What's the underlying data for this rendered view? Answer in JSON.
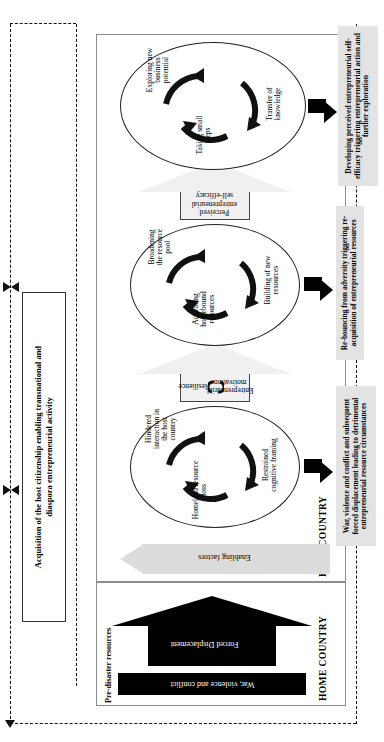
{
  "figure": {
    "top_box": {
      "line1": "Acquisition of the host citizenship enabling transnational and",
      "line2": "diaspora entrepreneurial activity"
    },
    "panels": {
      "home_label": "HOME COUNTRY",
      "host_label": "HOST COUNTRY"
    },
    "home_country": {
      "pre_disaster_label": "Pre-disaster resources",
      "war_bar_label": "War, violence and conflict",
      "displacement_arrow_label": "Forced Displacement"
    },
    "host_country": {
      "enabling_arrow_label": "Enabling factors"
    },
    "stages": [
      {
        "id": "stage-1",
        "ellipse_nodes": [
          "Homeland resource loss",
          "Hindered interaction in the host country",
          "Restrained cognitive framing"
        ],
        "outcome": "War, violence and conflict and subsequent forced displacement leading to detrimental entrepreneurial resource circumstances"
      },
      {
        "id": "stage-2",
        "ellipse_nodes": [
          "Activating homebound resources",
          "Broadening the resource pool",
          "Building of new resources"
        ],
        "outcome": "Re-bouncing from adversity triggering re-acquisition of entrepreneurial resources"
      },
      {
        "id": "stage-3",
        "ellipse_nodes": [
          "Taking small steps",
          "Exploring new business potential",
          "Transfer of knowledge"
        ],
        "outcome": "Developing perceived entrepreneurial self-efficacy triggering entrepreneurial action and further exploration"
      }
    ],
    "transitions": [
      {
        "id": "transition-1",
        "labels": [
          "Resilience",
          "Entrepreneurial motivation"
        ],
        "has_cycle_icon": true
      },
      {
        "id": "transition-2",
        "labels": [
          "Perceived entrepreneurial self-efficacy"
        ],
        "has_cycle_icon": false
      }
    ],
    "colors": {
      "panel_border": "#8c8c8c",
      "outcome_fill": "#e3e3e3",
      "enabling_arrow_fill": "#dcdcdc",
      "transition_arrow_fill": "#f0f0f0",
      "solid_black": "#000000"
    }
  }
}
